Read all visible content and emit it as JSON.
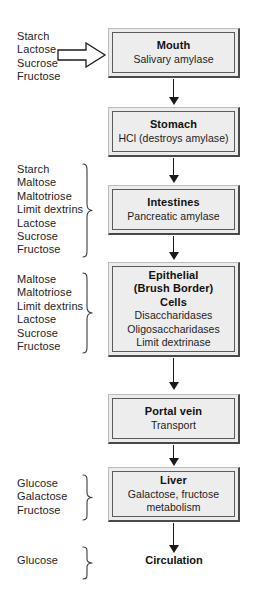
{
  "diagram": {
    "input_arrow_icon": "hollow-right-arrow-icon",
    "colors": {
      "box_fill": "#ededec",
      "box_border_dark": "#4a4a4a",
      "box_border_light": "#bdbdbd",
      "text": "#1a1a1a",
      "arrow": "#1a1a1a"
    }
  },
  "substrate_groups": [
    {
      "id": "mouth-inputs",
      "has_brace": false,
      "items": [
        "Starch",
        "Lactose",
        "Sucrose",
        "Fructose"
      ]
    },
    {
      "id": "intestines-inputs",
      "has_brace": true,
      "items": [
        "Starch",
        "Maltose",
        "Maltotriose",
        "Limit dextrins",
        "Lactose",
        "Sucrose",
        "Fructose"
      ]
    },
    {
      "id": "epithelial-inputs",
      "has_brace": true,
      "items": [
        "Maltose",
        "Maltotriose",
        "Limit dextrins",
        "Lactose",
        "Sucrose",
        "Fructose"
      ]
    },
    {
      "id": "liver-inputs",
      "has_brace": true,
      "items": [
        "Glucose",
        "Galactose",
        "Fructose"
      ]
    },
    {
      "id": "circulation-inputs",
      "has_brace": true,
      "items": [
        "Glucose"
      ]
    }
  ],
  "nodes": [
    {
      "id": "mouth",
      "type": "box",
      "title": "Mouth",
      "lines": [
        "Salivary amylase"
      ]
    },
    {
      "id": "stomach",
      "type": "box",
      "title": "Stomach",
      "lines": [
        "HCl (destroys amylase)"
      ]
    },
    {
      "id": "intestines",
      "type": "box",
      "title": "Intestines",
      "lines": [
        "Pancreatic amylase"
      ]
    },
    {
      "id": "epithelial",
      "type": "box",
      "title": "Epithelial",
      "title2": "(Brush Border)",
      "title3": "Cells",
      "lines": [
        "Disaccharidases",
        "Oligosaccharidases",
        "Limit dextrinase"
      ]
    },
    {
      "id": "portal-vein",
      "type": "box",
      "title": "Portal vein",
      "lines": [
        "Transport"
      ]
    },
    {
      "id": "liver",
      "type": "box",
      "title": "Liver",
      "lines": [
        "Galactose, fructose",
        "metabolism"
      ]
    },
    {
      "id": "circulation",
      "type": "plain",
      "title": "Circulation",
      "lines": []
    }
  ]
}
